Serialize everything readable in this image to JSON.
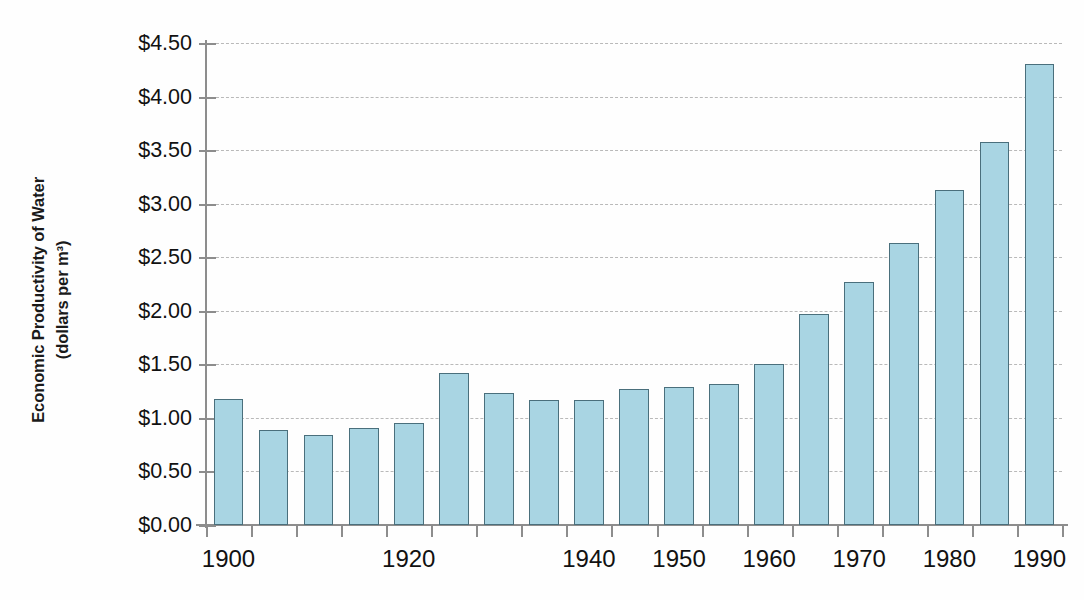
{
  "chart_data": {
    "type": "bar",
    "title": "",
    "subtitle": "",
    "xlabel": "",
    "ylabel": "Economic Productivity of Water (dollars per m³)",
    "ylabel_line1": "Economic Productivity of Water",
    "ylabel_line2": "(dollars per m³)",
    "ylim": [
      0,
      4.5
    ],
    "ytick_labels": [
      "$4.50",
      "$4.00",
      "$3.50",
      "$3.00",
      "$2.50",
      "$2.00",
      "$1.50",
      "$1.00",
      "$0.50",
      "$0.00"
    ],
    "ytick_values": [
      4.5,
      4.0,
      3.5,
      3.0,
      2.5,
      2.0,
      1.5,
      1.0,
      0.5,
      0.0
    ],
    "grid": true,
    "grid_style": "dashed-horizontal",
    "legend": "none",
    "bar_fill_color": "#a9d5e3",
    "bar_edge_color": "#4a6f7c",
    "axis_color": "#8d8d8d",
    "gridline_color": "#b9b9b9",
    "categories": [
      1900,
      1905,
      1910,
      1915,
      1920,
      1925,
      1930,
      1935,
      1940,
      1945,
      1950,
      1955,
      1960,
      1965,
      1970,
      1975,
      1980,
      1985,
      1990,
      1995,
      2000,
      2005,
      2010
    ],
    "values": [
      1.18,
      0.89,
      0.84,
      0.91,
      0.95,
      1.42,
      1.23,
      1.17,
      1.17,
      1.27,
      1.29,
      1.32,
      1.5,
      1.97,
      2.27,
      2.63,
      3.13,
      3.58,
      4.3,
      1.18,
      0.89,
      0.84,
      0.91
    ],
    "bars": [
      {
        "year": 1900,
        "value": 1.18
      },
      {
        "year": 1905,
        "value": 0.89
      },
      {
        "year": 1910,
        "value": 0.84
      },
      {
        "year": 1915,
        "value": 0.91
      },
      {
        "year": 1920,
        "value": 0.95
      },
      {
        "year": 1925,
        "value": 1.42
      },
      {
        "year": 1930,
        "value": 1.23
      },
      {
        "year": 1935,
        "value": 1.17
      },
      {
        "year": 1940,
        "value": 1.17
      },
      {
        "year": 1945,
        "value": 1.27
      },
      {
        "year": 1950,
        "value": 1.29
      },
      {
        "year": 1955,
        "value": 1.32
      },
      {
        "year": 1960,
        "value": 1.5
      },
      {
        "year": 1965,
        "value": 1.97
      },
      {
        "year": 1970,
        "value": 2.27
      },
      {
        "year": 1975,
        "value": 2.63
      },
      {
        "year": 1980,
        "value": 3.13
      },
      {
        "year": 1985,
        "value": 3.58
      },
      {
        "year": 1990,
        "value": 4.3
      }
    ],
    "x_axis_tick_count": 23,
    "xtick_labels": [
      "1900",
      "1920",
      "1940",
      "1950",
      "1960",
      "1970",
      "1980",
      "1990",
      "2000",
      "2010"
    ]
  },
  "axis": {
    "y_title_line1": "Economic Productivity of Water",
    "y_title_line2": "(dollars per m³)"
  }
}
